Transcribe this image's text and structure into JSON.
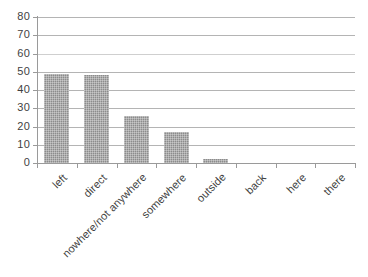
{
  "chart_data": {
    "type": "bar",
    "title": "",
    "subtitle": "",
    "xlabel": "",
    "ylabel": "",
    "categories": [
      "left",
      "direct",
      "nowhere/not anywhere",
      "somewhere",
      "outside",
      "back",
      "here",
      "there"
    ],
    "values": [
      49,
      48,
      26,
      17,
      2,
      0,
      0,
      0
    ],
    "ylim": [
      0,
      80
    ],
    "ytick_labels": [
      "0",
      "10",
      "20",
      "30",
      "40",
      "50",
      "60",
      "70",
      "80"
    ],
    "ytick_values": [
      0,
      10,
      20,
      30,
      40,
      50,
      60,
      70,
      80
    ],
    "grid": true,
    "grid_axis": "y",
    "legend": false,
    "legend_position": "none",
    "series": [
      {
        "name": "",
        "values": [
          49,
          48,
          26,
          17,
          2,
          0,
          0,
          0
        ],
        "color": "#8c8c8c"
      }
    ],
    "bar_color": "#8c8c8c",
    "gridline_color": "#b4b4b4",
    "axis_color": "#9a9a9a",
    "text_color": "#3f3f3f",
    "background_color": "#ffffff",
    "x_label_rotation": -45
  }
}
